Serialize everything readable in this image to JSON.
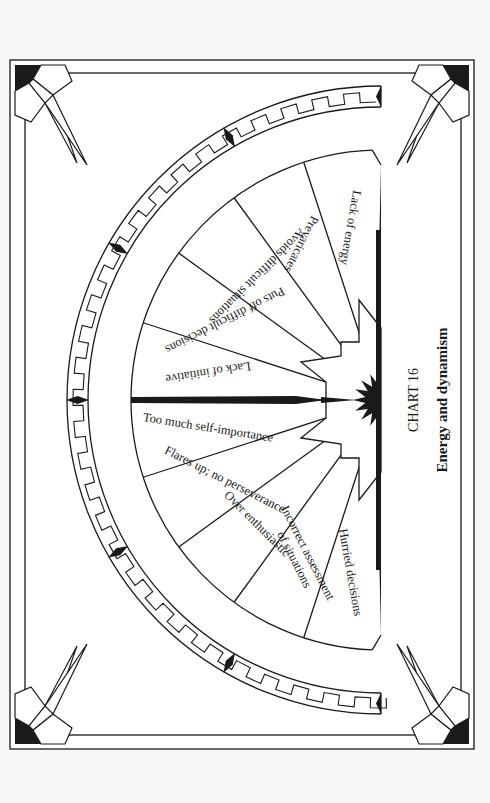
{
  "chart": {
    "number_label": "CHART 16",
    "title": "Energy and dynamism"
  },
  "segments": [
    {
      "label": "Lack of energy"
    },
    {
      "label": "Prevaricates"
    },
    {
      "label": "Avoids difficult situations"
    },
    {
      "label": "Puts off difficult decisions"
    },
    {
      "label": "Lack of initiative"
    },
    {
      "label": "Too much self-importance"
    },
    {
      "label": "Flares up; no perseverance"
    },
    {
      "label": "Over enthusiastic"
    },
    {
      "label": "Incorrect assessment",
      "label2": "of situations"
    },
    {
      "label": "Hurried decisions"
    }
  ],
  "colors": {
    "ink": "#1a1a1a",
    "paper": "#ffffff",
    "background": "#f7f7f5"
  }
}
